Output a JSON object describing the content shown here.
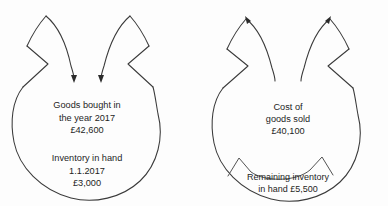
{
  "diagram": {
    "type": "inventory-flow",
    "background_color": "#fdfdfd",
    "line_color": "#3a3a3a",
    "text_color": "#1d1d1d",
    "left": {
      "name": "goods-bought-balloon",
      "arrow_direction": "in",
      "arrow_count": 2,
      "body_lines": [
        "Goods bought in",
        "the year 2017",
        "£42,600"
      ],
      "second_block_lines": [
        "Inventory in hand",
        "1.1.2017",
        "£3,000"
      ],
      "amount_purchases": "£42,600",
      "amount_opening_inventory": "£3,000",
      "year": "2017",
      "opening_date": "1.1.2017"
    },
    "right": {
      "name": "cost-of-goods-sold-balloon",
      "arrow_direction": "out",
      "arrow_count": 2,
      "body_lines": [
        "Cost of",
        "goods sold",
        "£40,100"
      ],
      "segment_lines": [
        "Remaining inventory",
        "in hand £5,500"
      ],
      "amount_cogs": "£40,100",
      "amount_remaining_inventory": "£5,500"
    }
  }
}
